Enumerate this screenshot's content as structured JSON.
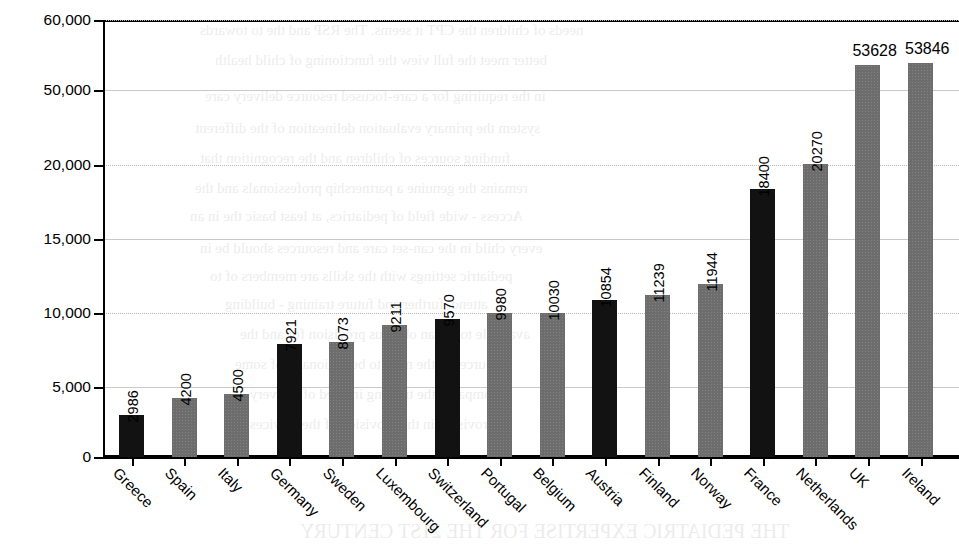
{
  "chart_data": {
    "type": "bar",
    "title": "",
    "xlabel": "",
    "ylabel": "Number of Inhabitants/Pediatrician",
    "categories": [
      "Greece",
      "Spain",
      "Italy",
      "Germany",
      "Sweden",
      "Luxembourg",
      "Switzerland",
      "Portugal",
      "Belgium",
      "Austria",
      "Finland",
      "Norway",
      "France",
      "Netherlands",
      "UK",
      "Ireland"
    ],
    "values": [
      2986,
      4200,
      4500,
      7921,
      8073,
      9211,
      9570,
      9980,
      10030,
      10854,
      11239,
      11944,
      18400,
      20270,
      53628,
      53846
    ],
    "value_labels": [
      "2986",
      "4200",
      "4500",
      "7921",
      "8073",
      "9211",
      "9570",
      "9980",
      "10030",
      "10854",
      "11239",
      "11944",
      "18400",
      "20270",
      "53628",
      "53846"
    ],
    "bar_colors": [
      "dark",
      "gray",
      "gray",
      "dark",
      "gray",
      "gray",
      "dark",
      "gray",
      "gray",
      "dark",
      "gray",
      "gray",
      "dark",
      "gray",
      "gray",
      "gray"
    ],
    "colors": {
      "dark": "#121212",
      "gray": "#6d6d6d",
      "gridline": "#c9c9c9",
      "axis": "#000000",
      "background": "#ffffff"
    },
    "y_ticks": [
      "0",
      "5,000",
      "10,000",
      "15,000",
      "20,000",
      "50,000",
      "60,000"
    ],
    "y_tick_values": [
      0,
      5000,
      10000,
      15000,
      20000,
      50000,
      60000
    ],
    "ylim": [
      0,
      60000
    ],
    "grid": true,
    "legend": "none",
    "axis_note": "non-linear broken y-axis: equal pixel spacing between successive labeled ticks"
  },
  "ghost_text": [
    {
      "text": "needs of children the CPT it seems. The RSP and the to towards",
      "x": 200,
      "y": 22,
      "size": 15
    },
    {
      "text": "better meet the full view the functioning of child health",
      "x": 215,
      "y": 52,
      "size": 15
    },
    {
      "text": "in the requiring for a care-focused resource delivery care",
      "x": 205,
      "y": 88,
      "size": 15
    },
    {
      "text": "system the primary evaluation delineation of the different",
      "x": 195,
      "y": 120,
      "size": 15
    },
    {
      "text": "funding sources of children and the recognition that",
      "x": 200,
      "y": 150,
      "size": 15
    },
    {
      "text": "remains the genuine a partnership professionals and the",
      "x": 195,
      "y": 180,
      "size": 15
    },
    {
      "text": "Access - wide field of pediatrics, at least basic the in an",
      "x": 190,
      "y": 208,
      "size": 15
    },
    {
      "text": "every child in the can-set care and resources should be in",
      "x": 200,
      "y": 240,
      "size": 15
    },
    {
      "text": "pediatric settings with the skills are members of to",
      "x": 210,
      "y": 268,
      "size": 15
    },
    {
      "text": "attend, further and future training - building",
      "x": 225,
      "y": 296,
      "size": 15
    },
    {
      "text": "available to the an obvious provision for and the",
      "x": 240,
      "y": 326,
      "size": 15
    },
    {
      "text": "resources in the need to be regionally of some",
      "x": 235,
      "y": 356,
      "size": 15
    },
    {
      "text": "compared the training in need of delivery",
      "x": 250,
      "y": 386,
      "size": 15
    },
    {
      "text": "provision in the provision of the services",
      "x": 250,
      "y": 416,
      "size": 15
    },
    {
      "text": "THE PEDIATRIC EXPERTISE FOR THE 21ST CENTURY",
      "x": 300,
      "y": 520,
      "size": 20
    }
  ]
}
